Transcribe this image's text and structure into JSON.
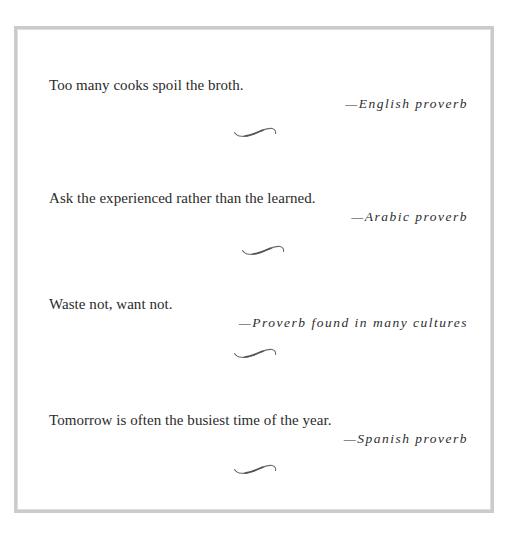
{
  "entries": [
    {
      "quote": "Too many cooks spoil the broth.",
      "attribution": "—English proverb",
      "ornament": "swash-divider-icon"
    },
    {
      "quote": "Ask the experienced rather than the learned.",
      "attribution": "—Arabic proverb",
      "ornament": "swash-divider-icon"
    },
    {
      "quote": "Waste not, want not.",
      "attribution": "—Proverb found in many cultures",
      "ornament": "swash-divider-icon"
    },
    {
      "quote": "Tomorrow is often the busiest time of the year.",
      "attribution": "—Spanish proverb",
      "ornament": "swash-divider-icon"
    }
  ],
  "colors": {
    "text": "#2b2b2b",
    "border": "#cbcbcb",
    "ornament": "#6b6b6b"
  }
}
